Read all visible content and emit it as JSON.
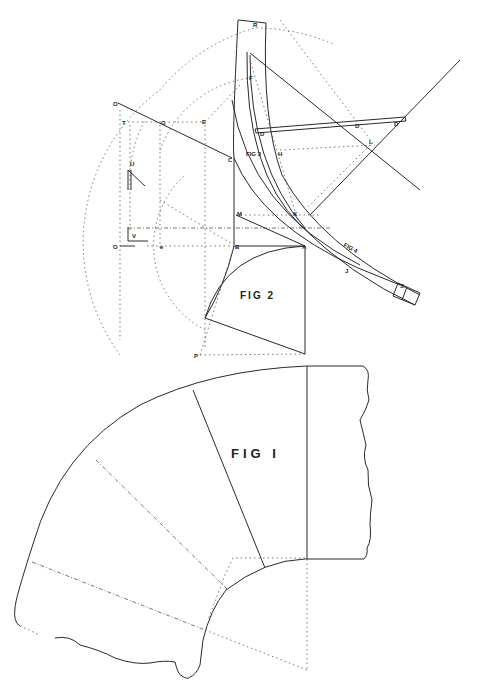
{
  "drawing": {
    "title": "Elbow / bend pattern development drawing",
    "figures": [
      {
        "id": "fig1",
        "label": "FIG  I"
      },
      {
        "id": "fig2",
        "label": "FIG  2"
      },
      {
        "id": "fig3",
        "label": "FIG 3"
      },
      {
        "id": "fig4",
        "label": "FIG 4"
      }
    ],
    "point_labels": {
      "R": "R",
      "F": "F",
      "O_top": "O",
      "T": "T",
      "G": "G",
      "E": "E",
      "C": "C",
      "H": "H",
      "U": "U",
      "V": "V",
      "O_left": "O",
      "e": "e",
      "M": "M",
      "B": "B",
      "A": "A",
      "K": "K",
      "J": "J",
      "L": "L",
      "P": "P",
      "D1": "D",
      "D2": "D",
      "D3": "D",
      "S": "S"
    }
  }
}
